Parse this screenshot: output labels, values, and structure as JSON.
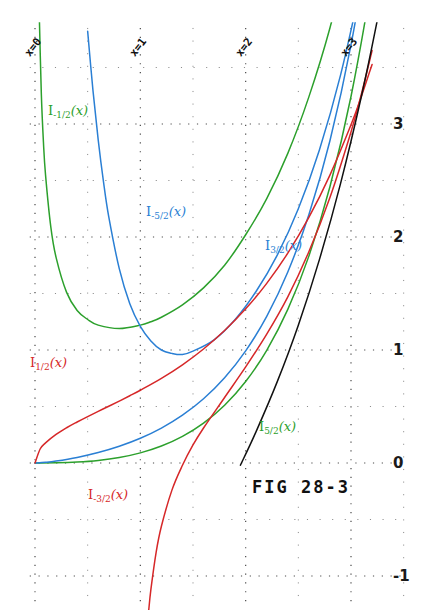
{
  "figure": {
    "caption": "FIG 28-3",
    "background": "#ffffff",
    "width": 423,
    "height": 612
  },
  "axes": {
    "y_ticks": [
      {
        "label": "3",
        "value": 3
      },
      {
        "label": "2",
        "value": 2
      },
      {
        "label": "1",
        "value": 1
      },
      {
        "label": "0",
        "value": 0
      },
      {
        "label": "-1",
        "value": -1
      }
    ],
    "x_ticks": [
      {
        "label": "x=0",
        "value": 0
      },
      {
        "label": "x=1",
        "value": 1
      },
      {
        "label": "x=2",
        "value": 2
      },
      {
        "label": "x=3",
        "value": 3
      }
    ],
    "grid": "dotted"
  },
  "curve_labels": [
    {
      "base": "I",
      "order": "-1/2",
      "arg": "(x)",
      "color": "#2ca02c"
    },
    {
      "base": "I",
      "order": "-5/2",
      "arg": "(x)",
      "color": "#2a7fd4"
    },
    {
      "base": "I",
      "order": "3/2",
      "arg": "(x)",
      "color": "#2a7fd4"
    },
    {
      "base": "I",
      "order": "1/2",
      "arg": "(x)",
      "color": "#d62728"
    },
    {
      "base": "I",
      "order": "5/2",
      "arg": "(x)",
      "color": "#2ca02c"
    },
    {
      "base": "I",
      "order": "-3/2",
      "arg": "(x)",
      "color": "#d62728"
    }
  ],
  "chart_data": {
    "type": "line",
    "title": "FIG 28-3",
    "xlabel": "x",
    "ylabel": "",
    "xlim": [
      -0.05,
      3.45
    ],
    "ylim": [
      -1.25,
      3.85
    ],
    "grid": true,
    "grid_style": "dotted",
    "legend": "inline-curve-labels",
    "x_tick_labels": [
      "x=0",
      "x=1",
      "x=2",
      "x=3"
    ],
    "x_tick_values": [
      0,
      1,
      2,
      3
    ],
    "y_tick_labels": [
      "3",
      "2",
      "1",
      "0",
      "-1"
    ],
    "y_tick_values": [
      3,
      2,
      1,
      0,
      -1
    ],
    "series": [
      {
        "name": "I_{1/2}(x)",
        "color": "#d62728",
        "x": [
          0.0,
          0.05,
          0.1,
          0.2,
          0.3,
          0.4,
          0.5,
          0.6,
          0.7,
          0.8,
          0.9,
          1.0,
          1.2,
          1.4,
          1.6,
          1.8,
          2.0,
          2.2,
          2.4,
          2.6,
          2.8,
          3.0,
          3.1,
          3.2
        ],
        "y": [
          0.0,
          0.126,
          0.178,
          0.253,
          0.312,
          0.363,
          0.411,
          0.457,
          0.502,
          0.548,
          0.595,
          0.644,
          0.749,
          0.869,
          1.009,
          1.172,
          1.364,
          1.59,
          1.857,
          2.173,
          2.548,
          2.993,
          3.248,
          3.527
        ]
      },
      {
        "name": "I_{3/2}(x)",
        "color": "#2a7fd4",
        "x": [
          0.0,
          0.1,
          0.2,
          0.4,
          0.6,
          0.8,
          1.0,
          1.2,
          1.4,
          1.6,
          1.8,
          2.0,
          2.2,
          2.4,
          2.6,
          2.8,
          3.0,
          3.2,
          3.35
        ],
        "y": [
          0.0,
          0.006,
          0.017,
          0.0491,
          0.0925,
          0.1482,
          0.219,
          0.3089,
          0.4231,
          0.5686,
          0.7544,
          0.9922,
          1.2975,
          1.6905,
          2.1973,
          2.8522,
          3.6999,
          4.7986,
          5.78
        ]
      },
      {
        "name": "I_{5/2}(x)",
        "color": "#2ca02c",
        "x": [
          0.0,
          0.2,
          0.4,
          0.6,
          0.8,
          1.0,
          1.2,
          1.4,
          1.6,
          1.8,
          2.0,
          2.2,
          2.4,
          2.6,
          2.8,
          3.0,
          3.2,
          3.35
        ],
        "y": [
          0.0,
          0.00136,
          0.00789,
          0.0224,
          0.0484,
          0.0897,
          0.1504,
          0.236,
          0.3534,
          0.5114,
          0.7212,
          0.9975,
          1.3591,
          1.8308,
          2.4449,
          3.2434,
          4.2816,
          5.25
        ]
      },
      {
        "name": "I_{-1/2}(x)",
        "color": "#2ca02c",
        "x": [
          0.04,
          0.06,
          0.08,
          0.1,
          0.15,
          0.2,
          0.3,
          0.4,
          0.5,
          0.6,
          0.8,
          1.0,
          1.1,
          1.2,
          1.4,
          1.6,
          1.8,
          2.0,
          2.2,
          2.4,
          2.6,
          2.8,
          3.0,
          3.1
        ],
        "y": [
          3.99,
          3.27,
          2.84,
          2.55,
          2.09,
          1.82,
          1.51,
          1.35,
          1.27,
          1.22,
          1.19,
          1.22,
          1.25,
          1.29,
          1.4,
          1.55,
          1.75,
          2.02,
          2.34,
          2.74,
          3.24,
          3.85,
          4.61,
          5.04
        ]
      },
      {
        "name": "I_{-3/2}(x)",
        "color": "#d62728",
        "x": [
          1.08,
          1.1,
          1.15,
          1.2,
          1.3,
          1.4,
          1.5,
          1.6,
          1.8,
          2.0,
          2.2,
          2.4,
          2.6,
          2.8,
          3.0,
          3.1,
          3.2
        ],
        "y": [
          -1.3,
          -1.12,
          -0.79,
          -0.56,
          -0.24,
          -0.02,
          0.16,
          0.31,
          0.58,
          0.85,
          1.14,
          1.47,
          1.87,
          2.35,
          2.93,
          3.27,
          3.65
        ]
      },
      {
        "name": "I_{-5/2}(x)",
        "color": "#2a7fd4",
        "x": [
          0.5,
          0.55,
          0.6,
          0.65,
          0.7,
          0.8,
          0.9,
          1.0,
          1.1,
          1.2,
          1.3,
          1.4,
          1.5,
          1.7,
          1.9,
          2.1,
          2.3,
          2.5,
          2.7,
          2.9,
          3.1,
          3.2
        ],
        "y": [
          3.82,
          3.3,
          2.86,
          2.49,
          2.18,
          1.72,
          1.41,
          1.21,
          1.08,
          1.0,
          0.97,
          0.96,
          0.99,
          1.09,
          1.27,
          1.52,
          1.84,
          2.25,
          2.77,
          3.43,
          4.26,
          4.75
        ]
      },
      {
        "name": "asymptote-black",
        "color": "#111111",
        "x": [
          1.95,
          2.1,
          2.3,
          2.5,
          2.7,
          2.9,
          3.1,
          3.25,
          3.4
        ],
        "y": [
          -0.02,
          0.28,
          0.72,
          1.22,
          1.8,
          2.47,
          3.25,
          3.92,
          4.65
        ]
      }
    ]
  }
}
